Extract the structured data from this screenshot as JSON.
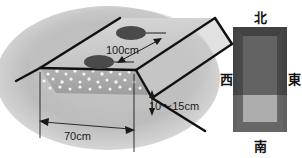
{
  "figure": {
    "title_alt": "",
    "panels": {
      "bed_diagram": {
        "name": "raised-bed-cross-section",
        "measurements": {
          "plant_spacing": "100cm",
          "bed_depth": "10〜15cm",
          "bed_width": "70cm"
        },
        "elements": {
          "planting_spot_count": 2,
          "granule_label": "white granules"
        }
      },
      "compass": {
        "name": "orientation-key",
        "directions": {
          "north": "北",
          "east": "東",
          "south": "南",
          "west": "西"
        }
      }
    },
    "colors": {
      "background_soil": "#b9b9b9",
      "bed_top": "#cfcfcf",
      "bed_face": "#a8a8a8",
      "line": "#111111",
      "plant_spot": "#4a4a4a",
      "compass_dark": "#565656",
      "compass_light": "#9a9a9a",
      "compass_edge": "#3c3c3c",
      "granule": "#f2f2f2"
    }
  }
}
